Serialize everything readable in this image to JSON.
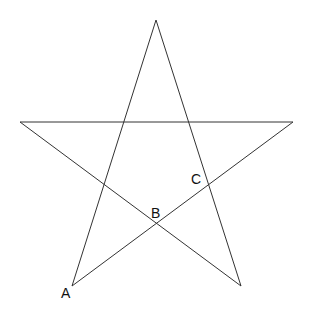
{
  "diagram": {
    "type": "pentagram",
    "stroke_color": "#333333",
    "vertices": {
      "top": [
        156,
        20
      ],
      "left": [
        20,
        122
      ],
      "right": [
        293,
        122
      ],
      "bottom_left": [
        72,
        286
      ],
      "bottom_right": [
        241,
        286
      ]
    },
    "labels": [
      {
        "text": "A",
        "x": 61,
        "y": 298
      },
      {
        "text": "B",
        "x": 151,
        "y": 218
      },
      {
        "text": "C",
        "x": 191,
        "y": 184
      }
    ]
  }
}
